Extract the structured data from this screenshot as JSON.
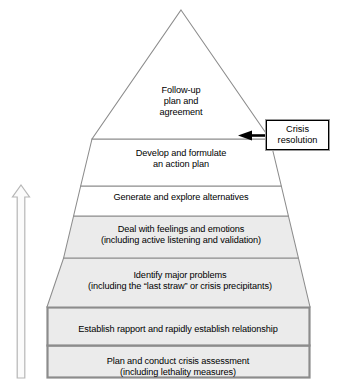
{
  "diagram": {
    "type": "pyramid",
    "orientation": "apex-top",
    "tier_count": 7,
    "reading_direction": "bottom-to-top",
    "tiers": [
      {
        "index": 1,
        "position": "apex",
        "label": "Follow-up\nplan and\nagreement",
        "lines": [
          "Follow-up",
          "plan and",
          "agreement"
        ],
        "fill": "#ffffff",
        "shape": "trapezoid"
      },
      {
        "index": 2,
        "label": "Develop and formulate\nan action plan",
        "lines": [
          "Develop and formulate",
          "an action plan"
        ],
        "fill": "#ffffff",
        "shape": "trapezoid"
      },
      {
        "index": 3,
        "label": "Generate and explore alternatives",
        "lines": [
          "Generate and explore alternatives"
        ],
        "fill": "#ffffff",
        "shape": "trapezoid"
      },
      {
        "index": 4,
        "label": "Deal with feelings and emotions\n(including active listening and validation)",
        "lines": [
          "Deal with feelings and emotions",
          "(including active listening and validation)"
        ],
        "fill": "#ebebeb",
        "shape": "trapezoid"
      },
      {
        "index": 5,
        "label": "Identify major problems\n(including the “last straw” or crisis precipitants)",
        "lines": [
          "Identify major problems",
          "(including the “last straw” or crisis precipitants)"
        ],
        "fill": "#ebebeb",
        "shape": "trapezoid"
      },
      {
        "index": 6,
        "label": "Establish rapport and rapidly establish relationship",
        "lines": [
          "Establish rapport and rapidly establish relationship"
        ],
        "fill": "#ebebeb",
        "shape": "rectangle"
      },
      {
        "index": 7,
        "position": "base",
        "label": "Plan and conduct crisis assessment\n(including lethality measures)",
        "lines": [
          "Plan and conduct crisis assessment",
          "(including lethality measures)"
        ],
        "fill": "#ebebeb",
        "shape": "rectangle"
      }
    ]
  },
  "callout": {
    "label": "Crisis\nresolution",
    "lines": [
      "Crisis",
      "resolution"
    ],
    "points_to_tier": 1,
    "pointer": "left-arrow"
  },
  "progress_arrow": {
    "name": "upward-progress-arrow",
    "direction": "up",
    "label": "",
    "style": "outlined"
  },
  "colors": {
    "outline": "#8c8c8c",
    "tier_fill_light": "#ebebeb",
    "tier_fill_white": "#ffffff",
    "base_border": "#8c8c8c",
    "callout_border": "#000000",
    "callout_shadow": "#9a9a9a",
    "arrow_outline": "#b0b0b0",
    "pointer_black": "#000000",
    "text": "#000000",
    "background": "#ffffff"
  }
}
